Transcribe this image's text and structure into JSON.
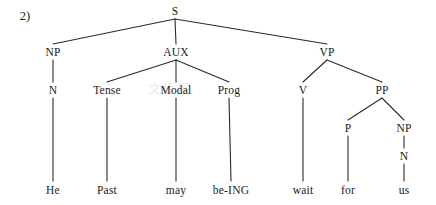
{
  "figure": {
    "item_number": "2)",
    "watermark": "文库网",
    "width": 436,
    "height": 205,
    "background_color": "#ffffff",
    "ink_color": "#1a1a1a",
    "line_color": "#2b2b2b"
  },
  "tree": {
    "type": "syntax-tree",
    "sentence": "He Past may be-ING wait for us",
    "nodes": [
      {
        "id": "S",
        "label": "S",
        "x": 175,
        "y": 11,
        "level": 0
      },
      {
        "id": "NP1",
        "label": "NP",
        "x": 53,
        "y": 52,
        "level": 1
      },
      {
        "id": "AUX",
        "label": "AUX",
        "x": 176,
        "y": 52,
        "level": 1
      },
      {
        "id": "VP",
        "label": "VP",
        "x": 327,
        "y": 52,
        "level": 1
      },
      {
        "id": "N1",
        "label": "N",
        "x": 53,
        "y": 90,
        "level": 2
      },
      {
        "id": "Tense",
        "label": "Tense",
        "x": 107,
        "y": 90,
        "level": 2
      },
      {
        "id": "Modal",
        "label": "Modal",
        "x": 176,
        "y": 90,
        "level": 2
      },
      {
        "id": "Prog",
        "label": "Prog",
        "x": 229,
        "y": 90,
        "level": 2
      },
      {
        "id": "V",
        "label": "V",
        "x": 303,
        "y": 90,
        "level": 2
      },
      {
        "id": "PP",
        "label": "PP",
        "x": 382,
        "y": 90,
        "level": 2
      },
      {
        "id": "P",
        "label": "P",
        "x": 348,
        "y": 128,
        "level": 3
      },
      {
        "id": "NP2",
        "label": "NP",
        "x": 404,
        "y": 128,
        "level": 3
      },
      {
        "id": "N2",
        "label": "N",
        "x": 404,
        "y": 156,
        "level": 4
      }
    ],
    "edges": [
      {
        "from": "S",
        "to": "NP1"
      },
      {
        "from": "S",
        "to": "AUX"
      },
      {
        "from": "S",
        "to": "VP"
      },
      {
        "from": "NP1",
        "to": "N1"
      },
      {
        "from": "AUX",
        "to": "Tense"
      },
      {
        "from": "AUX",
        "to": "Modal"
      },
      {
        "from": "AUX",
        "to": "Prog"
      },
      {
        "from": "VP",
        "to": "V"
      },
      {
        "from": "VP",
        "to": "PP"
      },
      {
        "from": "PP",
        "to": "P"
      },
      {
        "from": "PP",
        "to": "NP2"
      },
      {
        "from": "NP2",
        "to": "N2"
      },
      {
        "from": "N1",
        "to": "w_he"
      },
      {
        "from": "Tense",
        "to": "w_past"
      },
      {
        "from": "Modal",
        "to": "w_may"
      },
      {
        "from": "Prog",
        "to": "w_being"
      },
      {
        "from": "V",
        "to": "w_wait"
      },
      {
        "from": "P",
        "to": "w_for"
      },
      {
        "from": "N2",
        "to": "w_us"
      }
    ],
    "leaves": [
      {
        "id": "w_he",
        "label": "He",
        "x": 53,
        "y": 190
      },
      {
        "id": "w_past",
        "label": "Past",
        "x": 107,
        "y": 190
      },
      {
        "id": "w_may",
        "label": "may",
        "x": 176,
        "y": 190
      },
      {
        "id": "w_being",
        "label": "be-ING",
        "x": 231,
        "y": 190
      },
      {
        "id": "w_wait",
        "label": "wait",
        "x": 303,
        "y": 190
      },
      {
        "id": "w_for",
        "label": "for",
        "x": 348,
        "y": 190
      },
      {
        "id": "w_us",
        "label": "us",
        "x": 404,
        "y": 190
      }
    ]
  }
}
